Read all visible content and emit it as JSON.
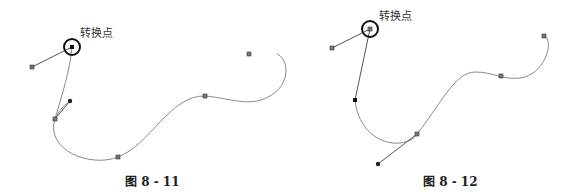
{
  "figures": [
    {
      "id": "fig-8-11",
      "caption": "图 8 - 11",
      "annotation": "转换点"
    },
    {
      "id": "fig-8-12",
      "caption": "图 8 - 12",
      "annotation": "转换点"
    }
  ],
  "colors": {
    "curve": "#8a8a8a",
    "handle_line": "#555555",
    "anchor": "#555555",
    "highlight_ring": "#111111"
  }
}
